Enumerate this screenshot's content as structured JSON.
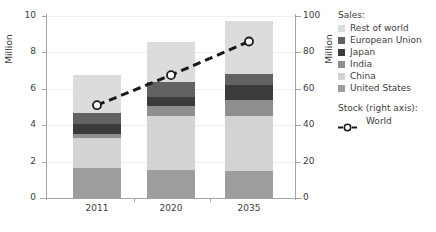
{
  "chart_data": {
    "type": "bar",
    "title": "",
    "subtitle": "",
    "categories": [
      "2011",
      "2020",
      "2035"
    ],
    "xlabel": "",
    "ylabel": "Million",
    "ylabel_right": "Million",
    "ylim": [
      0,
      10
    ],
    "ylim_right": [
      0,
      100
    ],
    "yticks": [
      0,
      2,
      4,
      6,
      8,
      10
    ],
    "yticks_right": [
      0,
      20,
      40,
      60,
      80,
      100
    ],
    "grid": true,
    "stacked": true,
    "legend_position": "right",
    "series": [
      {
        "name": "United States",
        "color": "#9d9d9d",
        "values": [
          1.65,
          1.55,
          1.5
        ]
      },
      {
        "name": "China",
        "color": "#d3d3d3",
        "values": [
          1.65,
          2.95,
          3.0
        ]
      },
      {
        "name": "India",
        "color": "#8f8f8f",
        "values": [
          0.2,
          0.55,
          0.9
        ]
      },
      {
        "name": "Japan",
        "color": "#3b3b3b",
        "values": [
          0.55,
          0.5,
          0.8
        ]
      },
      {
        "name": "European Union",
        "color": "#626262",
        "values": [
          0.6,
          0.85,
          0.6
        ]
      },
      {
        "name": "Rest of world",
        "color": "#dcdcdc",
        "values": [
          2.1,
          2.15,
          2.9
        ]
      }
    ],
    "totals": [
      6.75,
      8.55,
      9.7
    ],
    "overlay_series": [
      {
        "name": "World",
        "axis": "right",
        "type": "line",
        "style": "dashed",
        "marker": "open-circle",
        "color": "#1a1a1a",
        "values": [
          51,
          67.5,
          86
        ]
      }
    ]
  },
  "axes": {
    "left": {
      "title": "Million",
      "ticks": [
        "0",
        "2",
        "4",
        "6",
        "8",
        "10"
      ]
    },
    "right": {
      "title": "Million",
      "ticks": [
        "0",
        "20",
        "40",
        "60",
        "80",
        "100"
      ]
    },
    "x": {
      "ticks": [
        "2011",
        "2020",
        "2035"
      ]
    }
  },
  "legend": {
    "sales_heading": "Sales:",
    "sales_items": [
      {
        "label": "Rest of world",
        "color": "#dcdcdc"
      },
      {
        "label": "European Union",
        "color": "#626262"
      },
      {
        "label": "Japan",
        "color": "#3b3b3b"
      },
      {
        "label": "India",
        "color": "#8f8f8f"
      },
      {
        "label": "China",
        "color": "#d3d3d3"
      },
      {
        "label": "United States",
        "color": "#9d9d9d"
      }
    ],
    "stock_heading": "Stock (right axis):",
    "stock_items": [
      {
        "label": "World",
        "color": "#1a1a1a"
      }
    ]
  }
}
